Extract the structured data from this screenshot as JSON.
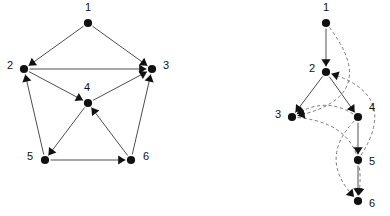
{
  "figure": {
    "background_color": "#ffffff",
    "node_color": "#111111",
    "solid_edge_color": "#3a3a3a",
    "dashed_edge_color": "#6b6b6b",
    "arrow_color": "#111111"
  },
  "chart_data": {
    "type": "diagram",
    "title": "",
    "subtitle": "",
    "panels": [
      {
        "id": "left",
        "name": "directed-graph",
        "label": "",
        "layout": "pentagon-with-center",
        "nodes": [
          {
            "id": "1",
            "label": "1",
            "x": 88,
            "y": 23,
            "label_x": 88,
            "label_y": 8
          },
          {
            "id": "2",
            "label": "2",
            "x": 24,
            "y": 69,
            "label_x": 10,
            "label_y": 66
          },
          {
            "id": "3",
            "label": "3",
            "x": 152,
            "y": 69,
            "label_x": 166,
            "label_y": 66
          },
          {
            "id": "4",
            "label": "4",
            "x": 88,
            "y": 103,
            "label_x": 87,
            "label_y": 88
          },
          {
            "id": "5",
            "label": "5",
            "x": 45,
            "y": 160,
            "label_x": 30,
            "label_y": 157
          },
          {
            "id": "6",
            "label": "6",
            "x": 131,
            "y": 160,
            "label_x": 146,
            "label_y": 157
          }
        ],
        "edges": [
          {
            "from": "1",
            "to": "2",
            "style": "solid",
            "directed": true
          },
          {
            "from": "1",
            "to": "3",
            "style": "solid",
            "directed": true
          },
          {
            "from": "2",
            "to": "3",
            "style": "solid",
            "directed": true
          },
          {
            "from": "2",
            "to": "4",
            "style": "solid",
            "directed": true
          },
          {
            "from": "5",
            "to": "2",
            "style": "solid",
            "directed": true
          },
          {
            "from": "4",
            "to": "5",
            "style": "solid",
            "directed": true
          },
          {
            "from": "5",
            "to": "6",
            "style": "solid",
            "directed": true
          },
          {
            "from": "6",
            "to": "4",
            "style": "solid",
            "directed": true
          },
          {
            "from": "6",
            "to": "3",
            "style": "solid",
            "directed": true
          },
          {
            "from": "4",
            "to": "3",
            "style": "solid",
            "directed": true
          }
        ]
      },
      {
        "id": "right",
        "name": "dfs-tree",
        "label": "",
        "layout": "dfs-tree",
        "nodes": [
          {
            "id": "1",
            "label": "1",
            "x": 326,
            "y": 23,
            "label_x": 326,
            "label_y": 8
          },
          {
            "id": "2",
            "label": "2",
            "x": 326,
            "y": 72,
            "label_x": 312,
            "label_y": 69
          },
          {
            "id": "3",
            "label": "3",
            "x": 292,
            "y": 117,
            "label_x": 278,
            "label_y": 115
          },
          {
            "id": "4",
            "label": "4",
            "x": 358,
            "y": 117,
            "label_x": 372,
            "label_y": 108
          },
          {
            "id": "5",
            "label": "5",
            "x": 358,
            "y": 160,
            "label_x": 372,
            "label_y": 162
          },
          {
            "id": "6",
            "label": "6",
            "x": 358,
            "y": 201,
            "label_x": 372,
            "label_y": 204
          }
        ],
        "edges": [
          {
            "from": "1",
            "to": "2",
            "style": "solid",
            "directed": true,
            "kind": "tree"
          },
          {
            "from": "2",
            "to": "3",
            "style": "solid",
            "directed": true,
            "kind": "tree"
          },
          {
            "from": "2",
            "to": "4",
            "style": "solid",
            "directed": true,
            "kind": "tree"
          },
          {
            "from": "4",
            "to": "5",
            "style": "solid",
            "directed": true,
            "kind": "tree"
          },
          {
            "from": "5",
            "to": "6",
            "style": "solid",
            "directed": true,
            "kind": "tree"
          },
          {
            "from": "1",
            "to": "3",
            "style": "dashed",
            "directed": true,
            "kind": "forward"
          },
          {
            "from": "4",
            "to": "3",
            "style": "dashed",
            "directed": true,
            "kind": "cross"
          },
          {
            "from": "5",
            "to": "2",
            "style": "dashed",
            "directed": true,
            "kind": "back"
          },
          {
            "from": "3",
            "to": "6",
            "style": "dashed",
            "directed": true,
            "kind": "cross"
          },
          {
            "from": "4",
            "to": "6",
            "style": "dashed",
            "directed": true,
            "kind": "forward"
          }
        ]
      }
    ]
  }
}
